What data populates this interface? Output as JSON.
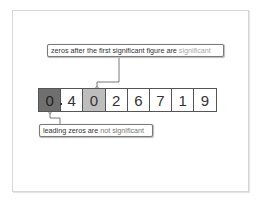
{
  "diagram": {
    "digits": [
      {
        "value": "0",
        "style": "dark",
        "note": "leading zero"
      },
      {
        "value": "4",
        "style": "plain"
      },
      {
        "value": "0",
        "style": "light",
        "note": "zero after first significant figure"
      },
      {
        "value": "2",
        "style": "plain"
      },
      {
        "value": "6",
        "style": "plain"
      },
      {
        "value": "7",
        "style": "plain"
      },
      {
        "value": "1",
        "style": "plain"
      },
      {
        "value": "9",
        "style": "plain"
      }
    ],
    "decimal_point": ".",
    "top_label": {
      "text": "zeros after the first significant figure are ",
      "highlight": "significant"
    },
    "bottom_label": {
      "text": "leading zeros are ",
      "highlight": "not significant"
    },
    "colors": {
      "dark_cell": "#6f6f6f",
      "light_cell": "#bdbdbd",
      "highlight_text": "#a8a8a8",
      "border": "#555555"
    }
  }
}
